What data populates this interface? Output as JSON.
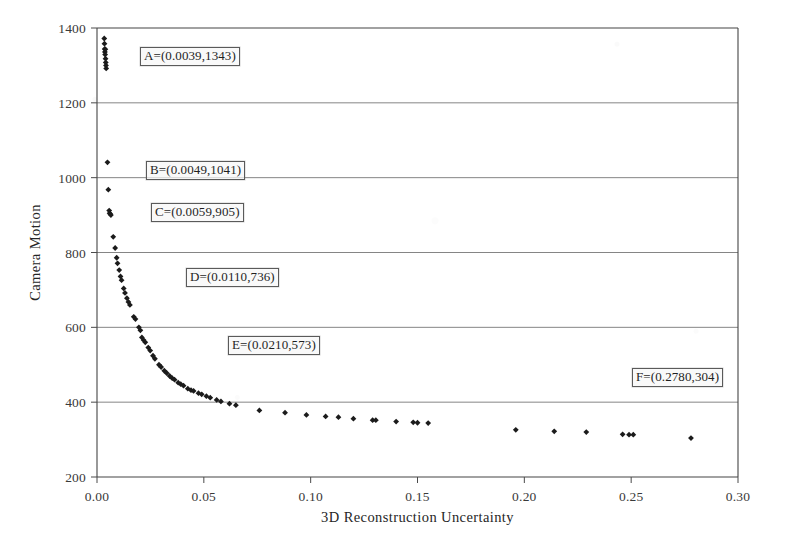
{
  "chart_data": {
    "type": "scatter",
    "title": "",
    "xlabel": "3D Reconstruction Uncertainty",
    "ylabel": "Camera Motion",
    "xlim": [
      0.0,
      0.3
    ],
    "ylim": [
      200,
      1400
    ],
    "xticks": [
      0.0,
      0.05,
      0.1,
      0.15,
      0.2,
      0.25,
      0.3
    ],
    "xtick_labels": [
      "0.00",
      "0.05",
      "0.10",
      "0.15",
      "0.20",
      "0.25",
      "0.30"
    ],
    "yticks": [
      200,
      400,
      600,
      800,
      1000,
      1200,
      1400
    ],
    "ytick_labels": [
      "200",
      "400",
      "600",
      "800",
      "1000",
      "1200",
      "1400"
    ],
    "grid": "horizontal",
    "legend": "none",
    "marker": "diamond",
    "marker_color": "#1b1b1b",
    "series": [
      {
        "name": "uncertainty-vs-motion",
        "points": [
          [
            0.0034,
            1372
          ],
          [
            0.0035,
            1358
          ],
          [
            0.0036,
            1344
          ],
          [
            0.0037,
            1336
          ],
          [
            0.0038,
            1329
          ],
          [
            0.0039,
            1343
          ],
          [
            0.004,
            1318
          ],
          [
            0.0041,
            1308
          ],
          [
            0.0042,
            1300
          ],
          [
            0.0043,
            1292
          ],
          [
            0.0049,
            1041
          ],
          [
            0.0053,
            968
          ],
          [
            0.0057,
            912
          ],
          [
            0.0059,
            905
          ],
          [
            0.0062,
            903
          ],
          [
            0.0065,
            900
          ],
          [
            0.0076,
            842
          ],
          [
            0.0085,
            812
          ],
          [
            0.0092,
            786
          ],
          [
            0.0096,
            771
          ],
          [
            0.0104,
            753
          ],
          [
            0.011,
            736
          ],
          [
            0.0115,
            726
          ],
          [
            0.0125,
            704
          ],
          [
            0.0131,
            692
          ],
          [
            0.014,
            678
          ],
          [
            0.0147,
            668
          ],
          [
            0.0154,
            660
          ],
          [
            0.0172,
            628
          ],
          [
            0.018,
            622
          ],
          [
            0.0196,
            600
          ],
          [
            0.0203,
            592
          ],
          [
            0.021,
            573
          ],
          [
            0.0218,
            566
          ],
          [
            0.0226,
            560
          ],
          [
            0.024,
            546
          ],
          [
            0.0249,
            538
          ],
          [
            0.0262,
            524
          ],
          [
            0.0271,
            516
          ],
          [
            0.029,
            500
          ],
          [
            0.03,
            494
          ],
          [
            0.0315,
            484
          ],
          [
            0.0326,
            478
          ],
          [
            0.034,
            470
          ],
          [
            0.0352,
            464
          ],
          [
            0.0363,
            460
          ],
          [
            0.038,
            452
          ],
          [
            0.0392,
            448
          ],
          [
            0.0405,
            444
          ],
          [
            0.0425,
            436
          ],
          [
            0.044,
            432
          ],
          [
            0.0452,
            430
          ],
          [
            0.0475,
            424
          ],
          [
            0.049,
            421
          ],
          [
            0.0512,
            416
          ],
          [
            0.053,
            412
          ],
          [
            0.056,
            406
          ],
          [
            0.058,
            402
          ],
          [
            0.062,
            396
          ],
          [
            0.065,
            392
          ],
          [
            0.076,
            378
          ],
          [
            0.088,
            372
          ],
          [
            0.098,
            366
          ],
          [
            0.107,
            362
          ],
          [
            0.113,
            360
          ],
          [
            0.12,
            356
          ],
          [
            0.129,
            352
          ],
          [
            0.1305,
            352
          ],
          [
            0.14,
            348
          ],
          [
            0.148,
            346
          ],
          [
            0.15,
            345
          ],
          [
            0.155,
            344
          ],
          [
            0.196,
            326
          ],
          [
            0.214,
            322
          ],
          [
            0.229,
            320
          ],
          [
            0.246,
            314
          ],
          [
            0.249,
            313
          ],
          [
            0.251,
            313
          ],
          [
            0.278,
            304
          ]
        ]
      }
    ],
    "annotations": [
      {
        "id": "A",
        "label": "A=(0.0039,1343)",
        "x": 0.0039,
        "y": 1343,
        "box_left_px": 140,
        "box_top_px": 47
      },
      {
        "id": "B",
        "label": "B=(0.0049,1041)",
        "x": 0.0049,
        "y": 1041,
        "box_left_px": 146,
        "box_top_px": 161
      },
      {
        "id": "C",
        "label": "C=(0.0059,905)",
        "x": 0.0059,
        "y": 905,
        "box_left_px": 151,
        "box_top_px": 203
      },
      {
        "id": "D",
        "label": "D=(0.0110,736)",
        "x": 0.011,
        "y": 736,
        "box_left_px": 186,
        "box_top_px": 268
      },
      {
        "id": "E",
        "label": "E=(0.0210,573)",
        "x": 0.021,
        "y": 573,
        "box_left_px": 228,
        "box_top_px": 336
      },
      {
        "id": "F",
        "label": "F=(0.2780,304)",
        "x": 0.278,
        "y": 304,
        "box_left_px": 632,
        "box_top_px": 368
      }
    ]
  }
}
